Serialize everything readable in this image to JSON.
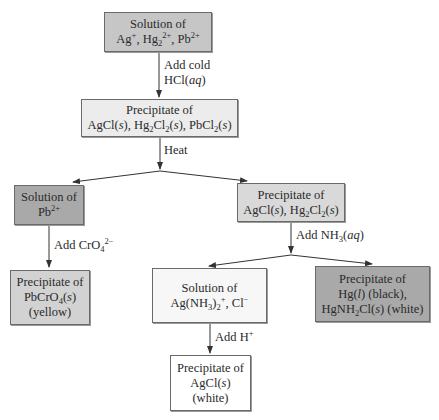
{
  "diagram": {
    "type": "flowchart",
    "colors": {
      "start": "#c6c6c6",
      "precip_all": "#ececec",
      "pb_solution": "#a9a9a9",
      "pbcro4": "#d2d2d2",
      "agcl_hg2cl2": "#d9d9d9",
      "ag_nh3": "#f7f7f7",
      "hg_precip": "#a9a9a9",
      "agcl_white": "#ffffff",
      "border": "#6a6a6a",
      "arrow": "#333333"
    },
    "nodes": {
      "start": {
        "line1": "Solution of",
        "line2": "Ag+, Hg2 2+, Pb2+"
      },
      "precip_all": {
        "line1": "Precipitate of",
        "line2": "AgCl(s), Hg2Cl2(s), PbCl2(s)"
      },
      "pb_solution": {
        "line1": "Solution of",
        "line2": "Pb2+"
      },
      "pbcro4": {
        "line1": "Precipitate of",
        "line2": "PbCrO4(s)",
        "line3": "(yellow)"
      },
      "agcl_hg2cl2": {
        "line1": "Precipitate of",
        "line2": "AgCl(s), Hg2Cl2(s)"
      },
      "ag_nh3": {
        "line1": "Solution of",
        "line2": "Ag(NH3)2+, Cl−"
      },
      "hg_precip": {
        "line1": "Precipitate of",
        "line2": "Hg(l) (black),",
        "line3": "HgNH2Cl(s) (white)"
      },
      "agcl_white": {
        "line1": "Precipitate of",
        "line2": "AgCl(s)",
        "line3": "(white)"
      }
    },
    "edges": [
      {
        "from": "start",
        "to": "precip_all",
        "label": "Add cold HCl(aq)"
      },
      {
        "from": "precip_all",
        "to": "pb_solution",
        "label": "Heat"
      },
      {
        "from": "precip_all",
        "to": "agcl_hg2cl2",
        "label": "Heat"
      },
      {
        "from": "pb_solution",
        "to": "pbcro4",
        "label": "Add CrO4 2−"
      },
      {
        "from": "agcl_hg2cl2",
        "to": "ag_nh3",
        "label": "Add NH3(aq)"
      },
      {
        "from": "agcl_hg2cl2",
        "to": "hg_precip",
        "label": "Add NH3(aq)"
      },
      {
        "from": "ag_nh3",
        "to": "agcl_white",
        "label": "Add H+"
      }
    ],
    "labels": {
      "hcl_1": "Add cold",
      "heat": "Heat",
      "cro4": "Add CrO",
      "nh3": "Add NH",
      "h_plus": "Add H"
    },
    "text": {
      "solution_of": "Solution of",
      "precipitate_of": "Precipitate of"
    }
  }
}
